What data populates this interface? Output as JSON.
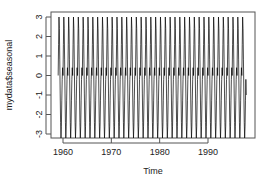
{
  "chart_data": {
    "type": "line",
    "title": "",
    "xlabel": "Time",
    "ylabel": "mydata$seasonal",
    "xlim": [
      1958.2,
      1998.4
    ],
    "ylim": [
      -3.3,
      3.3
    ],
    "x_ticks": [
      1960,
      1970,
      1980,
      1990
    ],
    "y_ticks": [
      -3,
      -2,
      -1,
      0,
      1,
      2,
      3
    ],
    "grid": false,
    "legend": null,
    "series": [
      {
        "name": "mydata$seasonal",
        "color": "#000000",
        "start": 1959.0,
        "end": 1997.9,
        "frequency": 12,
        "seasonal_pattern": [
          0.0,
          1.6,
          3.0,
          2.4,
          0.8,
          -0.9,
          -2.4,
          -3.2,
          -2.6,
          -1.3,
          -0.2,
          0.4
        ],
        "end_value": -1.0
      }
    ]
  }
}
